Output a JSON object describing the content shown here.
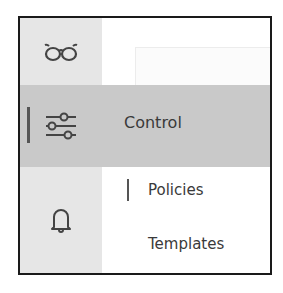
{
  "nav": {
    "items": [
      {
        "icon": "glasses-icon",
        "label": ""
      },
      {
        "icon": "sliders-icon",
        "label": "Control",
        "selected": true
      },
      {
        "icon": "bell-icon",
        "label": ""
      }
    ]
  },
  "submenu": {
    "items": [
      {
        "label": "Policies",
        "selected": true
      },
      {
        "label": "Templates",
        "selected": false
      }
    ]
  },
  "colors": {
    "rail": "#e6e6e6",
    "selected_row": "#c9c9c9",
    "indicator": "#555555",
    "text": "#3a3a3a",
    "frame": "#1a1a1a"
  }
}
